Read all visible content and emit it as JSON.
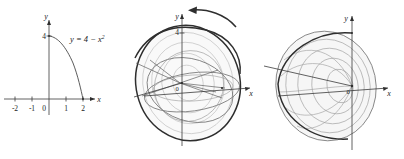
{
  "figure": {
    "caption_title": "Solid of revolution generated by rotating y = 4 - x² about the y-axis",
    "background_color": "#ffffff",
    "ink_color": "#2e2e2e"
  },
  "panels": [
    {
      "id": "graph",
      "name": "parabola-graph",
      "description": "Two dimensional plot of the parabola",
      "equation": {
        "base": "y = 4 − x",
        "exponent": "2",
        "full": "y = 4 − x²"
      },
      "axes": {
        "x_label": "x",
        "y_label": "y",
        "origin_label": "0"
      },
      "x_ticks": [
        "-2",
        "-1",
        "0",
        "1",
        "2"
      ],
      "y_ticks": [
        "4"
      ],
      "curve": {
        "name": "parabola",
        "vertex": [
          0,
          4
        ],
        "x_intercept": [
          2,
          0
        ]
      }
    },
    {
      "id": "partial",
      "name": "partial-revolution",
      "description": "Curve being swept about the y-axis, partial surface shown",
      "axes": {
        "x_label": "x",
        "y_label": "y",
        "origin_label": "0"
      },
      "y_ticks": [
        "4"
      ],
      "rotation_arrow": {
        "name": "rotation-direction-arrow",
        "direction": "counterclockwise-left"
      }
    },
    {
      "id": "solid",
      "name": "completed-solid",
      "description": "Completed paraboloid solid of revolution",
      "axes": {
        "x_label": "x",
        "y_label": "y",
        "origin_label": "0"
      }
    }
  ],
  "colors": {
    "outline_dark": "#2e2e2e",
    "outline_medium": "#6d6d6d",
    "mesh_light": "#9a9a9a",
    "mesh_faint": "#b5b5b5",
    "axis": "#3a3a3a",
    "surface": "#f4f4f4"
  }
}
